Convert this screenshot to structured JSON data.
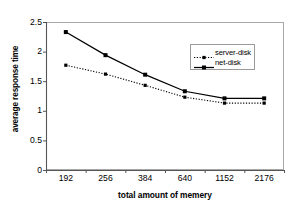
{
  "chart_data": {
    "type": "line",
    "title": "",
    "xlabel": "total amount of memery",
    "ylabel": "average response time",
    "categories": [
      "192",
      "256",
      "384",
      "640",
      "1152",
      "2176"
    ],
    "x_tick_labels": [
      "192",
      "256",
      "384",
      "640",
      "1152",
      "2176"
    ],
    "y_tick_labels": [
      "0",
      "0.5",
      "1",
      "1.5",
      "2",
      "2.5"
    ],
    "y_ticks": [
      0,
      0.5,
      1,
      1.5,
      2,
      2.5
    ],
    "ylim": [
      0,
      2.5
    ],
    "grid": false,
    "legend_position": "upper-right-inside",
    "series": [
      {
        "name": "server-disk",
        "values": [
          1.77,
          1.62,
          1.43,
          1.23,
          1.13,
          1.13
        ],
        "line_style": "dotted",
        "marker": "square",
        "color": "#000000"
      },
      {
        "name": "net-disk",
        "values": [
          2.33,
          1.94,
          1.61,
          1.33,
          1.21,
          1.21
        ],
        "line_style": "solid",
        "marker": "square",
        "color": "#000000"
      }
    ]
  },
  "legend": {
    "items": [
      {
        "label": "server-disk"
      },
      {
        "label": "net-disk"
      }
    ]
  },
  "axes": {
    "y_title": "average response time",
    "x_title": "total amount of memery"
  }
}
